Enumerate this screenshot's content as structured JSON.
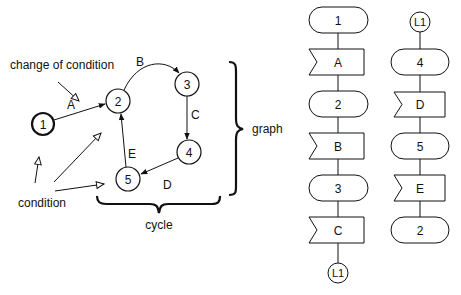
{
  "graph": {
    "nodes": [
      {
        "id": "1",
        "label": "1",
        "x": 43,
        "y": 124,
        "r": 11,
        "bold": true
      },
      {
        "id": "2",
        "label": "2",
        "x": 118,
        "y": 101,
        "r": 12,
        "bold": false
      },
      {
        "id": "3",
        "label": "3",
        "x": 187,
        "y": 84,
        "r": 12,
        "bold": false
      },
      {
        "id": "4",
        "label": "4",
        "x": 189,
        "y": 152,
        "r": 12,
        "bold": false
      },
      {
        "id": "5",
        "label": "5",
        "x": 128,
        "y": 179,
        "r": 12,
        "bold": false
      }
    ],
    "edges": [
      {
        "from": "1",
        "to": "2",
        "label": "A"
      },
      {
        "from": "2",
        "to": "3",
        "label": "B"
      },
      {
        "from": "3",
        "to": "4",
        "label": "C"
      },
      {
        "from": "4",
        "to": "5",
        "label": "D"
      },
      {
        "from": "5",
        "to": "2",
        "label": "E"
      }
    ],
    "annotations": {
      "change_of_condition": "change of condition",
      "condition": "condition",
      "graph": "graph",
      "cycle": "cycle"
    }
  },
  "flowchart": {
    "column1": [
      {
        "type": "state",
        "label": "1"
      },
      {
        "type": "event",
        "label": "A"
      },
      {
        "type": "state",
        "label": "2"
      },
      {
        "type": "event",
        "label": "B"
      },
      {
        "type": "state",
        "label": "3"
      },
      {
        "type": "event",
        "label": "C"
      },
      {
        "type": "connector",
        "label": "L1"
      }
    ],
    "column2": [
      {
        "type": "connector",
        "label": "L1"
      },
      {
        "type": "state",
        "label": "4"
      },
      {
        "type": "event",
        "label": "D"
      },
      {
        "type": "state",
        "label": "5"
      },
      {
        "type": "event",
        "label": "E"
      },
      {
        "type": "state",
        "label": "2"
      }
    ]
  }
}
